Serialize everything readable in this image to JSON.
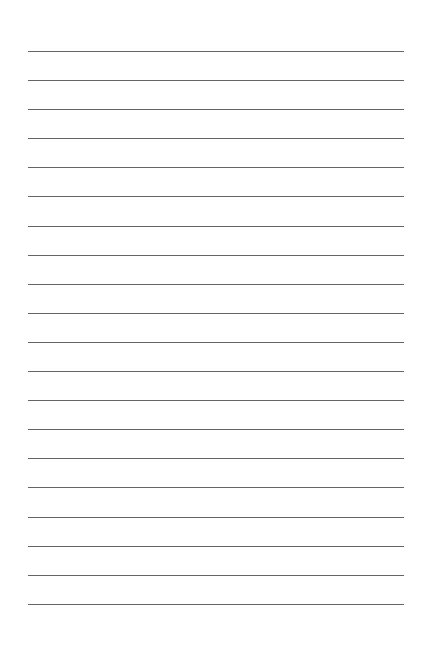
{
  "document": {
    "type": "lined-paper",
    "line_count": 20,
    "line_color": "#4a4a4a",
    "background": "#ffffff",
    "line_left": 28,
    "line_width": 376,
    "line_positions": [
      51,
      80,
      109,
      138,
      167,
      196,
      226,
      255,
      284,
      313,
      342,
      371,
      400,
      429,
      458,
      487,
      517,
      546,
      575,
      604
    ]
  }
}
